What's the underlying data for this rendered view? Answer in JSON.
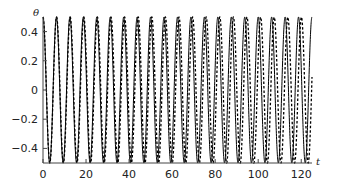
{
  "chart_data": {
    "type": "line",
    "title": "",
    "xlabel": "t",
    "ylabel": "θ",
    "xlim": [
      0,
      125
    ],
    "ylim": [
      -0.5,
      0.5
    ],
    "grid": false,
    "legend": null,
    "xticks": [
      0,
      20,
      40,
      60,
      80,
      100,
      120
    ],
    "xtick_labels": [
      "0",
      "20",
      "40",
      "60",
      "80",
      "100",
      "120"
    ],
    "yticks": [
      0.4,
      0.2,
      0,
      -0.2,
      -0.4
    ],
    "ytick_labels": [
      "0.4",
      "0.2",
      "0",
      "−0.2",
      "−0.4"
    ],
    "series": [
      {
        "name": "solid",
        "style": "solid",
        "color": "#000000",
        "amplitude": 0.5,
        "period": 6.25,
        "phase": 0,
        "description": "θ(t) = 0.5·cos(2πt/6.25)"
      },
      {
        "name": "dashed",
        "style": "dashed",
        "color": "#000000",
        "amplitude": 0.5,
        "period": 6.32,
        "phase": 0,
        "description": "θ(t) = 0.5·cos(2πt/6.32), slowly drifting out of phase"
      }
    ]
  }
}
